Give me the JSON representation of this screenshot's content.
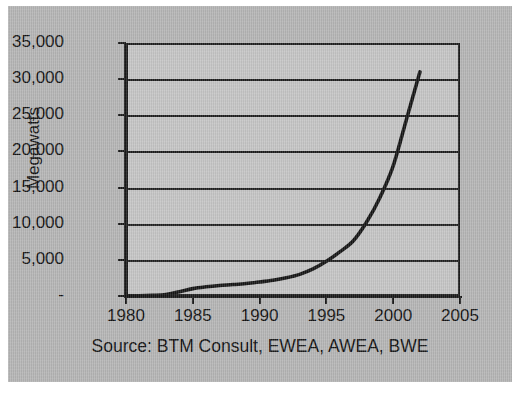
{
  "figure": {
    "background_color": "#b4b4b4",
    "plot_background_color": "#c4c4c4",
    "line_color": "#141414",
    "grid_color": "#1f1f1f",
    "source_note": "Source: BTM Consult, EWEA, AWEA, BWE"
  },
  "chart_data": {
    "type": "line",
    "title": "",
    "subtitle": "",
    "xlabel": "",
    "ylabel": "Megawatts",
    "annotation": "Source: BTM Consult, EWEA, AWEA, BWE",
    "xlim": [
      1980,
      2005
    ],
    "ylim": [
      0,
      35000
    ],
    "grid": "horizontal",
    "legend": "none",
    "x_tick_labels": [
      "1980",
      "1985",
      "1990",
      "1995",
      "2000",
      "2005"
    ],
    "x_ticks": [
      1980,
      1985,
      1990,
      1995,
      2000,
      2005
    ],
    "y_tick_labels": [
      "-",
      "5,000",
      "10,000",
      "15,000",
      "20,000",
      "25,000",
      "30,000",
      "35,000"
    ],
    "y_ticks": [
      0,
      5000,
      10000,
      15000,
      20000,
      25000,
      30000,
      35000
    ],
    "series": [
      {
        "name": "Global installed wind capacity",
        "x": [
          1980,
          1981,
          1982,
          1983,
          1984,
          1985,
          1986,
          1987,
          1988,
          1989,
          1990,
          1991,
          1992,
          1993,
          1994,
          1995,
          1996,
          1997,
          1998,
          1999,
          2000,
          2001,
          2002
        ],
        "values": [
          10,
          25,
          90,
          210,
          600,
          1020,
          1270,
          1450,
          1580,
          1730,
          1930,
          2170,
          2510,
          2990,
          3740,
          4800,
          6100,
          7600,
          10200,
          13600,
          18000,
          24500,
          31000
        ]
      }
    ]
  }
}
